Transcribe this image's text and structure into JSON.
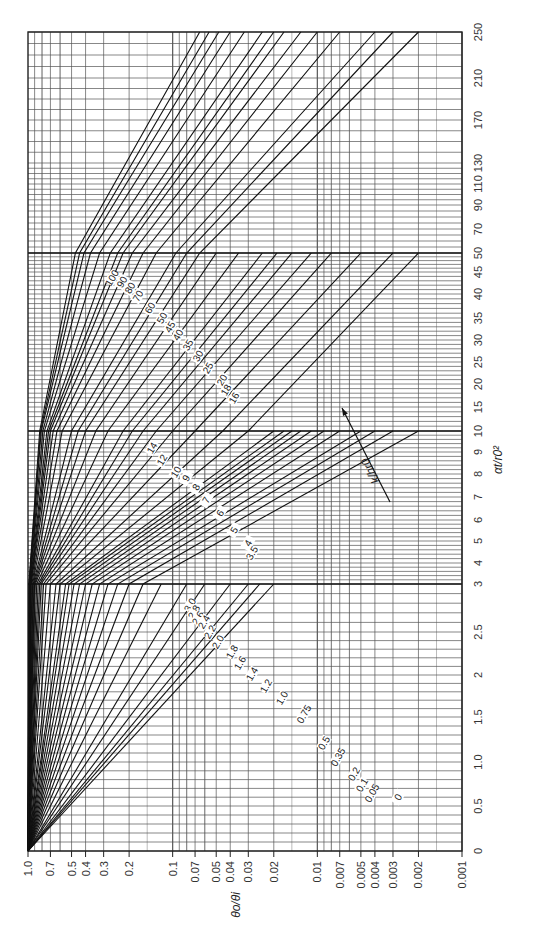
{
  "chart_data": {
    "type": "line",
    "title": "",
    "orientation": "rotated 90 degrees clockwise (log ratio axis runs along bottom, time axis vertical on right)",
    "xlabel": "θo/θi",
    "ylabel": "αt/r0²",
    "x_scale": "log",
    "xlim": [
      1.0,
      0.001
    ],
    "y_scale": "piecewise-linear",
    "ylim": [
      0,
      250
    ],
    "grid": true,
    "x_ticks": [
      "1.0",
      "0.7",
      "0.5",
      "0.4",
      "0.3",
      "0.2",
      "0.1",
      "0.07",
      "0.05",
      "0.04",
      "0.03",
      "0.02",
      "0.01",
      "0.007",
      "0.005",
      "0.004",
      "0.003",
      "0.002",
      "0.001"
    ],
    "x_tick_values": [
      1.0,
      0.7,
      0.5,
      0.4,
      0.3,
      0.2,
      0.1,
      0.07,
      0.05,
      0.04,
      0.03,
      0.02,
      0.01,
      0.007,
      0.005,
      0.004,
      0.003,
      0.002,
      0.001
    ],
    "y_ticks": [
      "0",
      "0.5",
      "1.0",
      "1.5",
      "2",
      "2.5",
      "3",
      "4",
      "5",
      "6",
      "7",
      "8",
      "9",
      "10",
      "15",
      "20",
      "25",
      "30",
      "35",
      "40",
      "45",
      "50",
      "70",
      "90",
      "110",
      "130",
      "170",
      "210",
      "250"
    ],
    "y_tick_values": [
      0,
      0.5,
      1.0,
      1.5,
      2,
      2.5,
      3,
      4,
      5,
      6,
      7,
      8,
      9,
      10,
      15,
      20,
      25,
      30,
      35,
      40,
      45,
      50,
      70,
      90,
      110,
      130,
      170,
      210,
      250
    ],
    "y_screen_px": [
      851,
      806,
      762,
      717,
      675,
      632,
      584,
      563,
      541,
      520,
      497,
      474,
      452,
      431,
      407,
      384,
      362,
      340,
      318,
      294,
      272,
      253,
      229,
      205,
      184,
      163,
      120,
      78,
      32
    ],
    "x_decade_px": {
      "1.0": 28,
      "0.1": 173,
      "0.01": 318,
      "0.001": 462
    },
    "parameter_label": "k/hr0",
    "series": [
      {
        "name": "0",
        "points": [
          [
            1.0,
            0
          ],
          [
            0.02,
            3
          ]
        ]
      },
      {
        "name": "0.05",
        "points": [
          [
            1.0,
            0
          ],
          [
            0.025,
            3
          ]
        ]
      },
      {
        "name": "0.1",
        "points": [
          [
            1.0,
            0
          ],
          [
            0.03,
            3
          ]
        ]
      },
      {
        "name": "0.2",
        "points": [
          [
            1.0,
            0
          ],
          [
            0.04,
            3
          ]
        ]
      },
      {
        "name": "0.35",
        "points": [
          [
            1.0,
            0
          ],
          [
            0.06,
            3
          ]
        ]
      },
      {
        "name": "0.5",
        "points": [
          [
            1.0,
            0
          ],
          [
            0.08,
            3
          ]
        ]
      },
      {
        "name": "0.75",
        "points": [
          [
            1.0,
            0
          ],
          [
            0.12,
            3
          ]
        ]
      },
      {
        "name": "1.0",
        "points": [
          [
            1.0,
            0
          ],
          [
            0.16,
            3
          ],
          [
            0.002,
            10
          ]
        ]
      },
      {
        "name": "1.2",
        "points": [
          [
            1.0,
            0
          ],
          [
            0.2,
            3
          ],
          [
            0.003,
            10
          ]
        ]
      },
      {
        "name": "1.4",
        "points": [
          [
            1.0,
            0
          ],
          [
            0.24,
            3
          ],
          [
            0.004,
            10
          ]
        ]
      },
      {
        "name": "1.6",
        "points": [
          [
            1.0,
            0
          ],
          [
            0.28,
            3
          ],
          [
            0.005,
            10
          ]
        ]
      },
      {
        "name": "1.8",
        "points": [
          [
            1.0,
            0
          ],
          [
            0.32,
            3
          ],
          [
            0.007,
            10
          ]
        ]
      },
      {
        "name": "2.0",
        "points": [
          [
            1.0,
            0
          ],
          [
            0.36,
            3
          ],
          [
            0.009,
            10
          ]
        ]
      },
      {
        "name": "2.2",
        "points": [
          [
            1.0,
            0
          ],
          [
            0.4,
            3
          ],
          [
            0.011,
            10
          ]
        ]
      },
      {
        "name": "2.4",
        "points": [
          [
            1.0,
            0
          ],
          [
            0.44,
            3
          ],
          [
            0.013,
            10
          ]
        ]
      },
      {
        "name": "2.6",
        "points": [
          [
            1.0,
            0
          ],
          [
            0.48,
            3
          ],
          [
            0.015,
            10
          ]
        ]
      },
      {
        "name": "2.8",
        "points": [
          [
            1.0,
            0
          ],
          [
            0.52,
            3
          ],
          [
            0.017,
            10
          ]
        ]
      },
      {
        "name": "3.0",
        "points": [
          [
            1.0,
            0
          ],
          [
            0.55,
            3
          ],
          [
            0.02,
            10
          ]
        ]
      },
      {
        "name": "3.5",
        "points": [
          [
            1.0,
            0
          ],
          [
            0.6,
            3
          ],
          [
            0.03,
            10
          ],
          [
            0.002,
            50
          ]
        ]
      },
      {
        "name": "4",
        "points": [
          [
            1.0,
            0
          ],
          [
            0.64,
            3
          ],
          [
            0.045,
            10
          ],
          [
            0.003,
            50
          ]
        ]
      },
      {
        "name": "5",
        "points": [
          [
            1.0,
            0
          ],
          [
            0.7,
            3
          ],
          [
            0.07,
            10
          ],
          [
            0.005,
            50
          ]
        ]
      },
      {
        "name": "6",
        "points": [
          [
            1.0,
            0
          ],
          [
            0.75,
            3
          ],
          [
            0.1,
            10
          ],
          [
            0.008,
            50
          ]
        ]
      },
      {
        "name": "7",
        "points": [
          [
            1.0,
            0
          ],
          [
            0.78,
            3
          ],
          [
            0.13,
            10
          ],
          [
            0.011,
            50
          ]
        ]
      },
      {
        "name": "8",
        "points": [
          [
            1.0,
            0
          ],
          [
            0.81,
            3
          ],
          [
            0.16,
            10
          ],
          [
            0.015,
            50
          ]
        ]
      },
      {
        "name": "9",
        "points": [
          [
            1.0,
            0
          ],
          [
            0.83,
            3
          ],
          [
            0.19,
            10
          ],
          [
            0.019,
            50
          ]
        ]
      },
      {
        "name": "10",
        "points": [
          [
            1.0,
            0
          ],
          [
            0.85,
            3
          ],
          [
            0.22,
            10
          ],
          [
            0.024,
            50
          ]
        ]
      },
      {
        "name": "12",
        "points": [
          [
            1.0,
            0
          ],
          [
            0.87,
            3
          ],
          [
            0.28,
            10
          ],
          [
            0.035,
            50
          ]
        ]
      },
      {
        "name": "14",
        "points": [
          [
            1.0,
            0
          ],
          [
            0.89,
            3
          ],
          [
            0.34,
            10
          ],
          [
            0.05,
            50
          ]
        ]
      },
      {
        "name": "16",
        "points": [
          [
            1.0,
            0
          ],
          [
            0.9,
            3
          ],
          [
            0.4,
            10
          ],
          [
            0.065,
            50
          ],
          [
            0.002,
            250
          ]
        ]
      },
      {
        "name": "18",
        "points": [
          [
            1.0,
            0
          ],
          [
            0.91,
            3
          ],
          [
            0.45,
            10
          ],
          [
            0.08,
            50
          ],
          [
            0.003,
            250
          ]
        ]
      },
      {
        "name": "20",
        "points": [
          [
            1.0,
            0
          ],
          [
            0.92,
            3
          ],
          [
            0.5,
            10
          ],
          [
            0.095,
            50
          ],
          [
            0.004,
            250
          ]
        ]
      },
      {
        "name": "25",
        "points": [
          [
            1.0,
            0
          ],
          [
            0.93,
            3
          ],
          [
            0.58,
            10
          ],
          [
            0.13,
            50
          ],
          [
            0.007,
            250
          ]
        ]
      },
      {
        "name": "30",
        "points": [
          [
            1.0,
            0
          ],
          [
            0.94,
            3
          ],
          [
            0.63,
            10
          ],
          [
            0.16,
            50
          ],
          [
            0.01,
            250
          ]
        ]
      },
      {
        "name": "35",
        "points": [
          [
            1.0,
            0
          ],
          [
            0.95,
            3
          ],
          [
            0.67,
            10
          ],
          [
            0.19,
            50
          ],
          [
            0.013,
            250
          ]
        ]
      },
      {
        "name": "40",
        "points": [
          [
            1.0,
            0
          ],
          [
            0.955,
            3
          ],
          [
            0.7,
            10
          ],
          [
            0.22,
            50
          ],
          [
            0.017,
            250
          ]
        ]
      },
      {
        "name": "45",
        "points": [
          [
            1.0,
            0
          ],
          [
            0.96,
            3
          ],
          [
            0.72,
            10
          ],
          [
            0.24,
            50
          ],
          [
            0.02,
            250
          ]
        ]
      },
      {
        "name": "50",
        "points": [
          [
            1.0,
            0
          ],
          [
            0.965,
            3
          ],
          [
            0.74,
            10
          ],
          [
            0.27,
            50
          ],
          [
            0.024,
            250
          ]
        ]
      },
      {
        "name": "60",
        "points": [
          [
            1.0,
            0
          ],
          [
            0.97,
            3
          ],
          [
            0.77,
            10
          ],
          [
            0.32,
            50
          ],
          [
            0.032,
            250
          ]
        ]
      },
      {
        "name": "70",
        "points": [
          [
            1.0,
            0
          ],
          [
            0.975,
            3
          ],
          [
            0.79,
            10
          ],
          [
            0.37,
            50
          ],
          [
            0.04,
            250
          ]
        ]
      },
      {
        "name": "80",
        "points": [
          [
            1.0,
            0
          ],
          [
            0.98,
            3
          ],
          [
            0.81,
            10
          ],
          [
            0.41,
            50
          ],
          [
            0.048,
            250
          ]
        ]
      },
      {
        "name": "90",
        "points": [
          [
            1.0,
            0
          ],
          [
            0.982,
            3
          ],
          [
            0.82,
            10
          ],
          [
            0.44,
            50
          ],
          [
            0.056,
            250
          ]
        ]
      },
      {
        "name": "100",
        "points": [
          [
            1.0,
            0
          ],
          [
            0.985,
            3
          ],
          [
            0.83,
            10
          ],
          [
            0.47,
            50
          ],
          [
            0.065,
            250
          ]
        ]
      }
    ],
    "curve_label_positions": [
      {
        "name": "100",
        "x": 112,
        "y": 278
      },
      {
        "name": "90",
        "x": 122,
        "y": 282
      },
      {
        "name": "80",
        "x": 130,
        "y": 288
      },
      {
        "name": "70",
        "x": 138,
        "y": 296
      },
      {
        "name": "60",
        "x": 150,
        "y": 308
      },
      {
        "name": "50",
        "x": 162,
        "y": 318
      },
      {
        "name": "45",
        "x": 170,
        "y": 327
      },
      {
        "name": "40",
        "x": 178,
        "y": 335
      },
      {
        "name": "35",
        "x": 188,
        "y": 345
      },
      {
        "name": "30",
        "x": 198,
        "y": 356
      },
      {
        "name": "25",
        "x": 208,
        "y": 368
      },
      {
        "name": "20",
        "x": 222,
        "y": 380
      },
      {
        "name": "18",
        "x": 226,
        "y": 390
      },
      {
        "name": "16",
        "x": 234,
        "y": 398
      },
      {
        "name": "14",
        "x": 152,
        "y": 448
      },
      {
        "name": "12",
        "x": 162,
        "y": 460
      },
      {
        "name": "10",
        "x": 176,
        "y": 472
      },
      {
        "name": "9",
        "x": 186,
        "y": 478
      },
      {
        "name": "8",
        "x": 196,
        "y": 487
      },
      {
        "name": "7",
        "x": 206,
        "y": 500
      },
      {
        "name": "6",
        "x": 220,
        "y": 513
      },
      {
        "name": "5",
        "x": 234,
        "y": 530
      },
      {
        "name": "4",
        "x": 248,
        "y": 543
      },
      {
        "name": "3.5",
        "x": 252,
        "y": 553
      },
      {
        "name": "3.0",
        "x": 190,
        "y": 605
      },
      {
        "name": "2.8",
        "x": 194,
        "y": 612
      },
      {
        "name": "2.6",
        "x": 198,
        "y": 618
      },
      {
        "name": "2.4",
        "x": 204,
        "y": 622
      },
      {
        "name": "2.2",
        "x": 210,
        "y": 632
      },
      {
        "name": "2.0",
        "x": 218,
        "y": 642
      },
      {
        "name": "1.8",
        "x": 232,
        "y": 652
      },
      {
        "name": "1.6",
        "x": 240,
        "y": 663
      },
      {
        "name": "1.4",
        "x": 252,
        "y": 674
      },
      {
        "name": "1.2",
        "x": 266,
        "y": 686
      },
      {
        "name": "1.0",
        "x": 282,
        "y": 698
      },
      {
        "name": "0.75",
        "x": 304,
        "y": 714
      },
      {
        "name": "0.5",
        "x": 324,
        "y": 743
      },
      {
        "name": "0.35",
        "x": 338,
        "y": 757
      },
      {
        "name": "0.2",
        "x": 354,
        "y": 774
      },
      {
        "name": "0.1",
        "x": 362,
        "y": 785
      },
      {
        "name": "0.05",
        "x": 372,
        "y": 793
      },
      {
        "name": "0",
        "x": 398,
        "y": 797
      }
    ],
    "annotations": [
      {
        "text": "k/hr0",
        "type": "arrow",
        "from": [
          390,
          502
        ],
        "to": [
          342,
          408
        ],
        "meaning": "increasing k/hr0"
      }
    ]
  }
}
